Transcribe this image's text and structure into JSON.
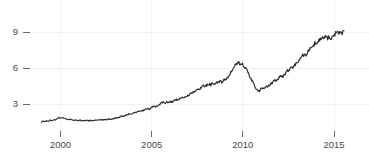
{
  "chart_data": {
    "type": "line",
    "title": "",
    "subtitle": "",
    "xlabel": "",
    "ylabel": "",
    "xlim": [
      1998.9,
      2015.7
    ],
    "ylim": [
      0.0,
      11.2
    ],
    "grid": true,
    "legend": null,
    "legend_position": "none",
    "line_color": "#2b2b2b",
    "background_color": "#ffffff",
    "grid_color": "#f0f0ee",
    "axis_text_color": "#4a4a4a",
    "x_ticks": [
      {
        "value": 2000,
        "label": "2000"
      },
      {
        "value": 2005,
        "label": "2005"
      },
      {
        "value": 2010,
        "label": "2010"
      },
      {
        "value": 2015,
        "label": "2015"
      }
    ],
    "y_ticks": [
      {
        "value": 3,
        "label": "3"
      },
      {
        "value": 6,
        "label": "6"
      },
      {
        "value": 9,
        "label": "9"
      }
    ],
    "series": [
      {
        "name": "index",
        "color": "#2b2b2b",
        "x": [
          1998.95,
          1999.05,
          1999.15,
          1999.25,
          1999.35,
          1999.45,
          1999.55,
          1999.65,
          1999.75,
          1999.85,
          1999.95,
          2000.05,
          2000.15,
          2000.25,
          2000.35,
          2000.45,
          2000.55,
          2000.65,
          2000.75,
          2000.85,
          2000.95,
          2001.05,
          2001.15,
          2001.25,
          2001.35,
          2001.45,
          2001.55,
          2001.65,
          2001.75,
          2001.85,
          2001.95,
          2002.05,
          2002.15,
          2002.25,
          2002.35,
          2002.45,
          2002.55,
          2002.65,
          2002.75,
          2002.85,
          2002.95,
          2003.05,
          2003.15,
          2003.25,
          2003.35,
          2003.45,
          2003.55,
          2003.65,
          2003.75,
          2003.85,
          2003.95,
          2004.05,
          2004.15,
          2004.25,
          2004.35,
          2004.45,
          2004.55,
          2004.65,
          2004.75,
          2004.85,
          2004.95,
          2005.05,
          2005.15,
          2005.25,
          2005.35,
          2005.45,
          2005.55,
          2005.65,
          2005.75,
          2005.85,
          2005.95,
          2006.05,
          2006.15,
          2006.25,
          2006.35,
          2006.45,
          2006.55,
          2006.65,
          2006.75,
          2006.85,
          2006.95,
          2007.05,
          2007.15,
          2007.25,
          2007.35,
          2007.45,
          2007.55,
          2007.65,
          2007.75,
          2007.85,
          2007.95,
          2008.05,
          2008.15,
          2008.25,
          2008.35,
          2008.45,
          2008.55,
          2008.65,
          2008.75,
          2008.85,
          2008.95,
          2009.05,
          2009.15,
          2009.25,
          2009.35,
          2009.45,
          2009.55,
          2009.65,
          2009.75,
          2009.85,
          2009.95,
          2010.05,
          2010.15,
          2010.25,
          2010.35,
          2010.45,
          2010.55,
          2010.65,
          2010.75,
          2010.85,
          2010.95,
          2011.05,
          2011.15,
          2011.25,
          2011.35,
          2011.45,
          2011.55,
          2011.65,
          2011.75,
          2011.85,
          2011.95,
          2012.05,
          2012.15,
          2012.25,
          2012.35,
          2012.45,
          2012.55,
          2012.65,
          2012.75,
          2012.85,
          2012.95,
          2013.05,
          2013.15,
          2013.25,
          2013.35,
          2013.45,
          2013.55,
          2013.65,
          2013.75,
          2013.85,
          2013.95,
          2014.05,
          2014.15,
          2014.25,
          2014.35,
          2014.45,
          2014.55,
          2014.65,
          2014.75,
          2014.85,
          2014.95,
          2015.05,
          2015.15,
          2015.25,
          2015.35,
          2015.45,
          2015.55
        ],
        "values": [
          1.5,
          1.56,
          1.52,
          1.61,
          1.58,
          1.66,
          1.62,
          1.71,
          1.68,
          1.82,
          1.86,
          1.8,
          1.88,
          1.79,
          1.74,
          1.7,
          1.73,
          1.68,
          1.64,
          1.67,
          1.62,
          1.66,
          1.61,
          1.64,
          1.59,
          1.63,
          1.6,
          1.64,
          1.61,
          1.66,
          1.63,
          1.68,
          1.64,
          1.7,
          1.66,
          1.72,
          1.69,
          1.75,
          1.71,
          1.78,
          1.8,
          1.86,
          1.83,
          1.92,
          2.0,
          1.95,
          2.06,
          2.1,
          2.18,
          2.14,
          2.24,
          2.31,
          2.27,
          2.36,
          2.42,
          2.38,
          2.47,
          2.53,
          2.6,
          2.56,
          2.66,
          2.74,
          2.82,
          2.78,
          2.9,
          2.98,
          3.1,
          3.16,
          3.08,
          3.18,
          3.12,
          3.22,
          3.18,
          3.3,
          3.38,
          3.33,
          3.44,
          3.52,
          3.48,
          3.6,
          3.68,
          3.76,
          3.88,
          3.96,
          4.06,
          4.18,
          4.3,
          4.24,
          4.42,
          4.52,
          4.46,
          4.6,
          4.68,
          4.62,
          4.76,
          4.7,
          4.82,
          4.76,
          4.88,
          4.82,
          4.94,
          5.06,
          5.2,
          5.38,
          5.62,
          5.9,
          6.14,
          6.32,
          6.48,
          6.34,
          6.46,
          6.2,
          5.94,
          5.7,
          5.44,
          5.12,
          4.8,
          4.48,
          4.2,
          4.02,
          4.16,
          4.34,
          4.26,
          4.44,
          4.38,
          4.56,
          4.68,
          4.86,
          5.02,
          4.94,
          5.12,
          5.3,
          5.22,
          5.42,
          5.58,
          5.74,
          5.9,
          6.1,
          6.02,
          6.26,
          6.44,
          6.62,
          6.8,
          6.98,
          7.16,
          7.08,
          7.3,
          7.52,
          7.7,
          7.88,
          8.06,
          7.94,
          8.2,
          8.4,
          8.58,
          8.46,
          8.66,
          8.42,
          8.58,
          8.34,
          8.6,
          8.84,
          9.06,
          8.86,
          9.1,
          8.88,
          9.12
        ]
      }
    ],
    "annotations": [],
    "notable_points": {
      "start": {
        "x": 1999.0,
        "y": 1.5
      },
      "early_peak": {
        "x": 2000.1,
        "y": 1.88
      },
      "trough_2002": {
        "x": 2002.0,
        "y": 1.6
      },
      "peak_2008": {
        "x": 2008.5,
        "y": 6.5
      },
      "crash_trough_2009": {
        "x": 2009.2,
        "y": 4.0
      },
      "peak_2015": {
        "x": 2015.0,
        "y": 10.5
      },
      "end": {
        "x": 2015.6,
        "y": 8.5
      }
    }
  }
}
